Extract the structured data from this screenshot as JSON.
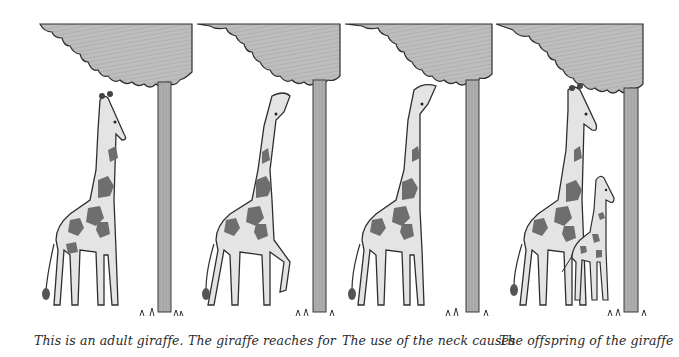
{
  "figure": {
    "panels": [
      {
        "caption": "This is an adult giraffe.",
        "caption_x": 34,
        "tree": {
          "canopy_left": 40,
          "canopy_right": 192,
          "trunk_x": 164,
          "trunk_w": 13
        },
        "giraffe": {
          "x": 70,
          "pose": "standing",
          "head": "level"
        }
      },
      {
        "caption": "The giraffe reaches for",
        "caption_x": 188,
        "tree": {
          "canopy_left": 197,
          "canopy_right": 340,
          "trunk_x": 313,
          "trunk_w": 13
        },
        "giraffe": {
          "x": 230,
          "pose": "raised-leg",
          "head": "up"
        }
      },
      {
        "caption": "The use of the neck causes",
        "caption_x": 342,
        "tree": {
          "canopy_left": 345,
          "canopy_right": 492,
          "trunk_x": 466,
          "trunk_w": 13
        },
        "giraffe": {
          "x": 375,
          "pose": "standing",
          "head": "up-high"
        }
      },
      {
        "caption": "The offspring of the giraffe",
        "caption_x": 499,
        "tree": {
          "canopy_left": 496,
          "canopy_right": 643,
          "trunk_x": 624,
          "trunk_w": 14
        },
        "giraffe": {
          "x": 510,
          "pose": "standing-tall",
          "head": "level"
        },
        "calf": {
          "x": 585
        }
      }
    ],
    "colors": {
      "canopy": "#b8b8b8",
      "trunk": "#a9a9a9",
      "outline": "#2e2e2e",
      "body": "#e4e4e4",
      "spot": "#6e6e6e",
      "caption": "#2a2a2a",
      "background": "#ffffff"
    }
  }
}
